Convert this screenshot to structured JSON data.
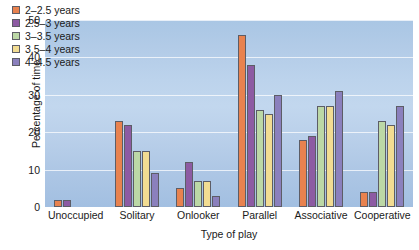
{
  "chart_data": {
    "type": "bar",
    "title": "",
    "xlabel": "Type of play",
    "ylabel": "Percentage of time",
    "ylim": [
      0,
      50
    ],
    "yticks": [
      0,
      10,
      20,
      30,
      40,
      50
    ],
    "grid": true,
    "legend_position": "top-left",
    "categories": [
      "Unoccupied",
      "Solitary",
      "Onlooker",
      "Parallel",
      "Associative",
      "Cooperative"
    ],
    "series": [
      {
        "name": "2–2.5 years",
        "color": "#e8824f",
        "values": [
          2,
          23,
          5,
          46,
          18,
          4
        ]
      },
      {
        "name": "2.5–3 years",
        "color": "#8d5ba3",
        "values": [
          2,
          22,
          12,
          38,
          19,
          4
        ]
      },
      {
        "name": "3–3.5 years",
        "color": "#bcd8a6",
        "values": [
          0,
          15,
          7,
          26,
          27,
          23
        ]
      },
      {
        "name": "3.5–4 years",
        "color": "#f2dc92",
        "values": [
          0,
          15,
          7,
          25,
          27,
          22
        ]
      },
      {
        "name": "4–4.5 years",
        "color": "#8b80bd",
        "values": [
          0,
          9,
          3,
          30,
          31,
          27
        ]
      }
    ]
  }
}
